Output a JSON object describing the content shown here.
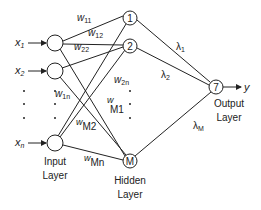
{
  "diagram": {
    "type": "neural-network",
    "colors": {
      "stroke": "#222222",
      "background": "#ffffff",
      "text": "#222222"
    },
    "inputs": [
      {
        "label": "x",
        "sub": "1"
      },
      {
        "label": "x",
        "sub": "2"
      },
      {
        "label": "x",
        "sub": "n"
      }
    ],
    "hidden_nodes": [
      "1",
      "2",
      "M"
    ],
    "output_node": "7",
    "output_label": "y",
    "layer_labels": {
      "input": [
        "Input",
        "Layer"
      ],
      "hidden": [
        "Hidden",
        "Layer"
      ],
      "output": [
        "Output",
        "Layer"
      ]
    },
    "weights": {
      "w11": {
        "base": "w",
        "sub": "11"
      },
      "w12": {
        "base": "w",
        "sub": "12"
      },
      "w22": {
        "base": "w",
        "sub": "22"
      },
      "w1n": {
        "base": "w",
        "sub": "1n"
      },
      "w2n": {
        "base": "w",
        "sub": "2n"
      },
      "wM1": {
        "base": "w",
        "sub": "M1"
      },
      "wM2": {
        "base": "w",
        "sub": "M2"
      },
      "wMn": {
        "base": "w",
        "sub": "Mn"
      }
    },
    "lambdas": {
      "l1": {
        "base": "λ",
        "sub": "1"
      },
      "l2": {
        "base": "λ",
        "sub": "2"
      },
      "lM": {
        "base": "λ",
        "sub": "M"
      }
    }
  }
}
